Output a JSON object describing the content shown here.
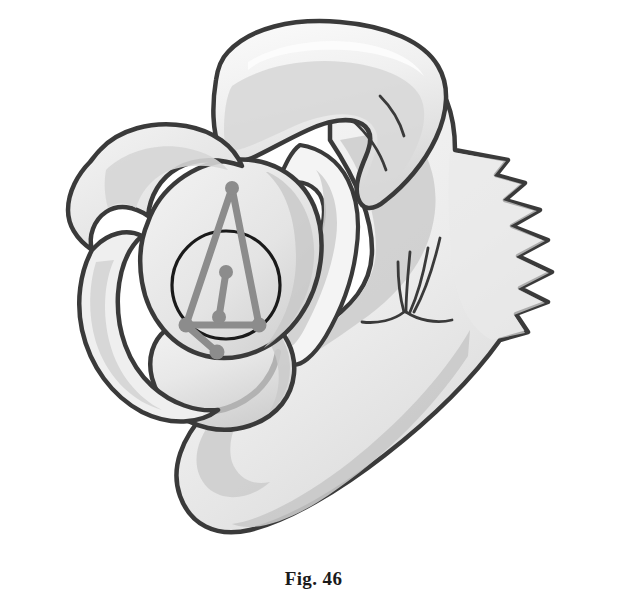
{
  "figure": {
    "caption": "Fig. 46",
    "type": "anatomical-illustration",
    "background_color": "#ffffff",
    "outline_color": "#3a3a3a",
    "annotation_color": "#8c8c8c",
    "circle_color": "#1a1a1a",
    "fills": {
      "bone_light": "#f2f2f2",
      "bone_mid": "#e3e3e3",
      "bone_shadow": "#d2d2d2",
      "bone_deep": "#c6c6c6",
      "highlight": "#fafafa"
    },
    "parts": [
      {
        "name": "acromion-process",
        "region": "top"
      },
      {
        "name": "coracoid-process",
        "region": "upper-left"
      },
      {
        "name": "glenoid-fossa",
        "region": "center-left"
      },
      {
        "name": "humeral-head",
        "region": "lower-center-left"
      },
      {
        "name": "scapular-spine",
        "region": "center-right"
      },
      {
        "name": "infraspinous-fossa",
        "region": "right"
      },
      {
        "name": "vertebral-border-serrated",
        "region": "far-right"
      },
      {
        "name": "lateral-border",
        "region": "bottom"
      },
      {
        "name": "muscle-fan-lines",
        "region": "center-right"
      }
    ],
    "annotation": {
      "label": "geometric-measurement-overlay",
      "circle": {
        "cx": 226,
        "cy": 285,
        "r": 54
      },
      "nodes": [
        {
          "id": "apex",
          "x": 232,
          "y": 188
        },
        {
          "id": "mid-center",
          "x": 226,
          "y": 272
        },
        {
          "id": "mid-lower",
          "x": 219,
          "y": 317
        },
        {
          "id": "left-lower",
          "x": 186,
          "y": 325
        },
        {
          "id": "right-lower",
          "x": 259,
          "y": 325
        },
        {
          "id": "bottom-spur",
          "x": 217,
          "y": 352
        }
      ],
      "segments": [
        {
          "from": "apex",
          "to": "left-lower"
        },
        {
          "from": "apex",
          "to": "right-lower"
        },
        {
          "from": "left-lower",
          "to": "right-lower"
        },
        {
          "from": "mid-center",
          "to": "mid-lower"
        },
        {
          "from": "left-lower",
          "to": "bottom-spur"
        }
      ],
      "arc": {
        "label": "humeral-head-arc",
        "color": "#b0b0b0"
      }
    }
  }
}
